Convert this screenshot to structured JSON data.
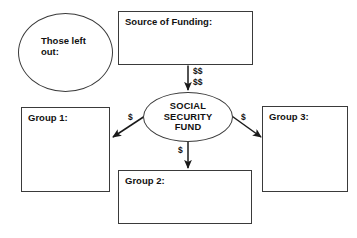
{
  "diagram": {
    "background_color": "#ffffff",
    "stroke_color": "#3a3a3a",
    "text_color": "#111111",
    "nodes": {
      "those_left_out": {
        "label": "Those left\nout:",
        "shape": "ellipse"
      },
      "source_of_funding": {
        "label": "Source of Funding:",
        "shape": "rectangle"
      },
      "social_security_fund": {
        "label": "SOCIAL\nSECURITY\nFUND",
        "shape": "ellipse"
      },
      "group_1": {
        "label": "Group 1:",
        "shape": "rectangle"
      },
      "group_2": {
        "label": "Group 2:",
        "shape": "rectangle"
      },
      "group_3": {
        "label": "Group 3:",
        "shape": "rectangle"
      }
    },
    "flows": {
      "funding_to_fund": {
        "label": "$$\n$$",
        "from": "source_of_funding",
        "to": "social_security_fund",
        "direction": "down"
      },
      "fund_to_group_1": {
        "label": "$",
        "from": "social_security_fund",
        "to": "group_1",
        "direction": "down-left"
      },
      "fund_to_group_2": {
        "label": "$",
        "from": "social_security_fund",
        "to": "group_2",
        "direction": "down"
      },
      "fund_to_group_3": {
        "label": "$",
        "from": "social_security_fund",
        "to": "group_3",
        "direction": "down-right"
      }
    }
  }
}
